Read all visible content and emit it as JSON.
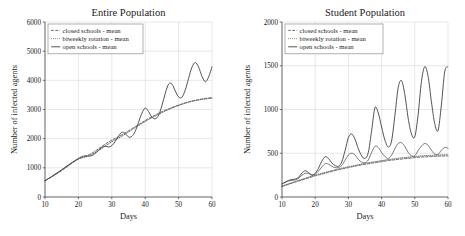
{
  "figure": {
    "background_color": "#ffffff",
    "panels": [
      "left",
      "right"
    ]
  },
  "chart_data": [
    {
      "id": "entire-population",
      "type": "line",
      "title": "Entire Population",
      "xlabel": "Days",
      "ylabel": "Number of infected agents",
      "xlim": [
        10,
        60
      ],
      "ylim": [
        0,
        6000
      ],
      "xticks": [
        10,
        20,
        30,
        40,
        50,
        60
      ],
      "yticks": [
        0,
        1000,
        2000,
        3000,
        4000,
        5000,
        6000
      ],
      "xtick_labels": [
        "10",
        "20",
        "30",
        "40",
        "50",
        "60"
      ],
      "ytick_labels": [
        "0",
        "1000",
        "2000",
        "3000",
        "4000",
        "5000",
        "6000"
      ],
      "grid": true,
      "legend_position": "upper left",
      "x": [
        10,
        11,
        12,
        13,
        14,
        15,
        16,
        17,
        18,
        19,
        20,
        21,
        22,
        23,
        24,
        25,
        26,
        27,
        28,
        29,
        30,
        31,
        32,
        33,
        34,
        35,
        36,
        37,
        38,
        39,
        40,
        41,
        42,
        43,
        44,
        45,
        46,
        47,
        48,
        49,
        50,
        51,
        52,
        53,
        54,
        55,
        56,
        57,
        58,
        59,
        60
      ],
      "series": [
        {
          "name": "closed schools - mean",
          "style": "dashed",
          "color": "#4f4f4f",
          "values": [
            560,
            625,
            690,
            760,
            830,
            905,
            985,
            1065,
            1150,
            1230,
            1300,
            1350,
            1390,
            1440,
            1500,
            1570,
            1650,
            1730,
            1810,
            1880,
            1950,
            2010,
            2070,
            2130,
            2200,
            2270,
            2340,
            2410,
            2480,
            2550,
            2620,
            2690,
            2750,
            2810,
            2870,
            2925,
            2975,
            3020,
            3065,
            3110,
            3150,
            3190,
            3230,
            3260,
            3290,
            3315,
            3340,
            3360,
            3380,
            3395,
            3410
          ]
        },
        {
          "name": "biweekly rotation - mean",
          "style": "dotted",
          "color": "#5a5a5a",
          "values": [
            560,
            630,
            700,
            775,
            850,
            930,
            1010,
            1090,
            1170,
            1245,
            1305,
            1340,
            1370,
            1410,
            1460,
            1520,
            1590,
            1665,
            1745,
            1820,
            1895,
            1960,
            2020,
            2085,
            2155,
            2230,
            2305,
            2380,
            2450,
            2520,
            2590,
            2655,
            2715,
            2775,
            2835,
            2895,
            2950,
            3000,
            3050,
            3095,
            3140,
            3180,
            3215,
            3250,
            3280,
            3305,
            3325,
            3345,
            3360,
            3375,
            3385
          ]
        },
        {
          "name": "open schools - mean",
          "style": "solid",
          "color": "#4a4a4a",
          "values": [
            560,
            630,
            700,
            780,
            855,
            935,
            1015,
            1095,
            1175,
            1250,
            1320,
            1385,
            1410,
            1400,
            1420,
            1490,
            1600,
            1700,
            1740,
            1715,
            1760,
            1900,
            2080,
            2220,
            2180,
            2060,
            2080,
            2250,
            2560,
            2870,
            3050,
            2930,
            2740,
            2680,
            2800,
            3130,
            3550,
            3870,
            3870,
            3640,
            3430,
            3420,
            3670,
            4070,
            4450,
            4610,
            4450,
            4140,
            3950,
            4120,
            4460
          ]
        }
      ]
    },
    {
      "id": "student-population",
      "type": "line",
      "title": "Student Population",
      "xlabel": "Days",
      "ylabel": "Number of infected agents",
      "xlim": [
        10,
        60
      ],
      "ylim": [
        0,
        2000
      ],
      "xticks": [
        10,
        20,
        30,
        40,
        50,
        60
      ],
      "yticks": [
        0,
        500,
        1000,
        1500,
        2000
      ],
      "xtick_labels": [
        "10",
        "20",
        "30",
        "40",
        "50",
        "60"
      ],
      "ytick_labels": [
        "0",
        "500",
        "1000",
        "1500",
        "2000"
      ],
      "grid": true,
      "legend_position": "upper left",
      "x": [
        10,
        11,
        12,
        13,
        14,
        15,
        16,
        17,
        18,
        19,
        20,
        21,
        22,
        23,
        24,
        25,
        26,
        27,
        28,
        29,
        30,
        31,
        32,
        33,
        34,
        35,
        36,
        37,
        38,
        39,
        40,
        41,
        42,
        43,
        44,
        45,
        46,
        47,
        48,
        49,
        50,
        51,
        52,
        53,
        54,
        55,
        56,
        57,
        58,
        59,
        60
      ],
      "series": [
        {
          "name": "closed schools - mean",
          "style": "dashed",
          "color": "#4f4f4f",
          "values": [
            120,
            132,
            145,
            158,
            170,
            182,
            194,
            206,
            218,
            230,
            242,
            252,
            262,
            272,
            282,
            292,
            302,
            312,
            320,
            328,
            336,
            344,
            352,
            360,
            368,
            374,
            380,
            386,
            392,
            398,
            404,
            410,
            416,
            421,
            426,
            430,
            434,
            438,
            442,
            446,
            450,
            453,
            456,
            458,
            460,
            462,
            464,
            466,
            468,
            469,
            470
          ]
        },
        {
          "name": "biweekly rotation - mean",
          "style": "dotted",
          "color": "#5a5a5a",
          "values": [
            125,
            138,
            151,
            164,
            177,
            190,
            202,
            214,
            226,
            238,
            250,
            261,
            271,
            281,
            291,
            301,
            311,
            320,
            329,
            337,
            345,
            353,
            361,
            369,
            377,
            384,
            391,
            397,
            403,
            409,
            415,
            421,
            427,
            432,
            437,
            442,
            447,
            451,
            455,
            459,
            463,
            466,
            469,
            472,
            474,
            476,
            478,
            480,
            481,
            482,
            483
          ]
        },
        {
          "name": "open schools - mean",
          "style": "solid",
          "color": "#4a4a4a",
          "values": [
            150,
            170,
            190,
            200,
            205,
            225,
            275,
            300,
            280,
            250,
            270,
            330,
            410,
            460,
            440,
            390,
            360,
            350,
            400,
            530,
            680,
            720,
            660,
            550,
            470,
            440,
            510,
            760,
            1020,
            960,
            800,
            650,
            570,
            640,
            930,
            1250,
            1330,
            1170,
            900,
            720,
            690,
            940,
            1320,
            1490,
            1380,
            1090,
            840,
            760,
            1050,
            1430,
            1490
          ]
        },
        {
          "name": "open schools - mean (small oscillation overlay)",
          "style": "solid-thin",
          "color": "#555555",
          "values": [
            150,
            168,
            182,
            190,
            196,
            214,
            248,
            272,
            268,
            252,
            262,
            296,
            344,
            380,
            376,
            350,
            336,
            336,
            360,
            420,
            480,
            500,
            480,
            430,
            398,
            392,
            424,
            510,
            580,
            566,
            508,
            462,
            440,
            478,
            552,
            612,
            620,
            578,
            510,
            472,
            472,
            530,
            582,
            612,
            590,
            534,
            492,
            486,
            534,
            566,
            556
          ]
        }
      ]
    }
  ],
  "legend": {
    "items": [
      {
        "label": "closed schools - mean",
        "style": "dashed"
      },
      {
        "label": "biweekly rotation - mean",
        "style": "dotted"
      },
      {
        "label": "open schools - mean",
        "style": "solid"
      }
    ]
  }
}
